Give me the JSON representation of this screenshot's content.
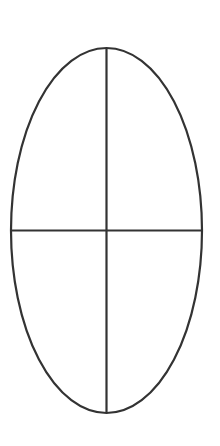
{
  "diagram": {
    "shape": "ellipse-quartered",
    "stroke_color": "#333333",
    "background": "#ffffff",
    "ellipse": {
      "cx": 106.5,
      "cy": 230.5,
      "rx": 95.5,
      "ry": 182.5
    },
    "vertical_line": {
      "x": 106.5,
      "y1": 48,
      "y2": 413
    },
    "horizontal_line": {
      "y": 230.5,
      "x1": 11,
      "x2": 202
    }
  }
}
